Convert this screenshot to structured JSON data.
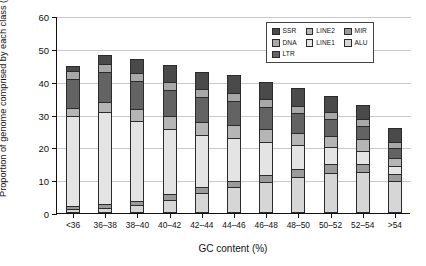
{
  "chart_data": {
    "type": "bar",
    "stacked": true,
    "title": "",
    "xlabel": "GC content (%)",
    "ylabel": "Proportion of genome comprised by each class (%)",
    "ylim": [
      0,
      60
    ],
    "yticks": [
      0,
      10,
      20,
      30,
      40,
      50,
      60
    ],
    "grid": true,
    "legend_position": "top-right",
    "categories": [
      "<36",
      "36–38",
      "38–40",
      "40–42",
      "42–44",
      "44–46",
      "46–48",
      "48–50",
      "50–52",
      "52–54",
      ">54"
    ],
    "series": [
      {
        "name": "ALU",
        "color": "#d6d6d6",
        "values": [
          1.2,
          1.6,
          2.3,
          4.1,
          6.0,
          7.8,
          9.4,
          11.0,
          12.2,
          12.4,
          9.6
        ]
      },
      {
        "name": "MIR",
        "color": "#9a9a9a",
        "values": [
          1.0,
          1.1,
          1.3,
          1.6,
          1.9,
          2.1,
          2.3,
          2.5,
          2.6,
          2.6,
          2.2
        ]
      },
      {
        "name": "LINE1",
        "color": "#e4e4e4",
        "values": [
          27.5,
          28.0,
          24.5,
          20.0,
          16.0,
          13.0,
          10.0,
          7.2,
          5.2,
          4.0,
          2.4
        ]
      },
      {
        "name": "LINE2",
        "color": "#b5b5b5",
        "values": [
          2.4,
          3.1,
          3.5,
          3.7,
          3.8,
          3.9,
          3.9,
          3.8,
          3.6,
          3.4,
          2.6
        ]
      },
      {
        "name": "LTR",
        "color": "#636363",
        "values": [
          8.8,
          9.2,
          8.6,
          8.0,
          7.6,
          7.2,
          6.6,
          5.9,
          5.0,
          4.2,
          3.1
        ]
      },
      {
        "name": "DNA",
        "color": "#a8a8a8",
        "values": [
          2.3,
          2.4,
          2.4,
          2.4,
          2.4,
          2.5,
          2.4,
          2.3,
          2.2,
          2.0,
          1.6
        ]
      },
      {
        "name": "SSR",
        "color": "#4a4a4a",
        "values": [
          1.5,
          2.6,
          4.4,
          5.2,
          5.3,
          5.5,
          5.4,
          5.3,
          4.8,
          4.4,
          4.5
        ]
      }
    ],
    "legend_entries": [
      {
        "label": "SSR",
        "color": "#4a4a4a"
      },
      {
        "label": "DNA",
        "color": "#a8a8a8"
      },
      {
        "label": "LTR",
        "color": "#636363"
      },
      {
        "label": "LINE2",
        "color": "#b5b5b5"
      },
      {
        "label": "LINE1",
        "color": "#e4e4e4"
      },
      {
        "label": "MIR",
        "color": "#9a9a9a"
      },
      {
        "label": "ALU",
        "color": "#d6d6d6"
      }
    ]
  }
}
